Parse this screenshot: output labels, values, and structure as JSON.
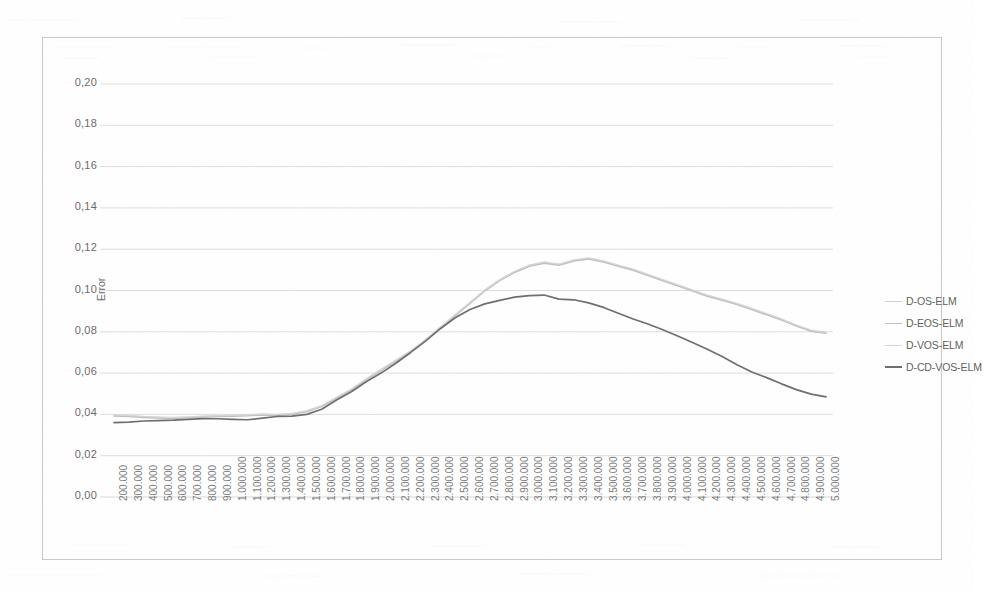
{
  "axes": {
    "y_title": "Error",
    "y_ticks": [
      "0,20",
      "0,18",
      "0,16",
      "0,14",
      "0,12",
      "0,10",
      "0,08",
      "0,06",
      "0,04",
      "0,02",
      "0,00"
    ],
    "x_ticks": [
      "200.000",
      "300.000",
      "400.000",
      "500.000",
      "600.000",
      "700.000",
      "800.000",
      "900.000",
      "1.000.000",
      "1.100.000",
      "1.200.000",
      "1.300.000",
      "1.400.000",
      "1.500.000",
      "1.600.000",
      "1.700.000",
      "1.800.000",
      "1.900.000",
      "2.000.000",
      "2.100.000",
      "2.200.000",
      "2.300.000",
      "2.400.000",
      "2.500.000",
      "2.600.000",
      "2.700.000",
      "2.800.000",
      "2.900.000",
      "3.000.000",
      "3.100.000",
      "3.200.000",
      "3.300.000",
      "3.400.000",
      "3.500.000",
      "3.600.000",
      "3.700.000",
      "3.800.000",
      "3.900.000",
      "4.000.000",
      "4.100.000",
      "4.200.000",
      "4.300.000",
      "4.400.000",
      "4.500.000",
      "4.600.000",
      "4.700.000",
      "4.800.000",
      "4.900.000",
      "5.000.000"
    ]
  },
  "legend": {
    "items": [
      {
        "label": "D-OS-ELM",
        "color": "#cfcfcf"
      },
      {
        "label": "D-EOS-ELM",
        "color": "#bfbfbf"
      },
      {
        "label": "D-VOS-ELM",
        "color": "#d6d6d6"
      },
      {
        "label": "D-CD-VOS-ELM",
        "color": "#6e6e6e"
      }
    ]
  },
  "chart_data": {
    "type": "line",
    "title": "",
    "xlabel": "",
    "ylabel": "Error",
    "ylim": [
      0.0,
      0.2
    ],
    "grid": true,
    "legend_position": "right",
    "x": [
      200000,
      300000,
      400000,
      500000,
      600000,
      700000,
      800000,
      900000,
      1000000,
      1100000,
      1200000,
      1300000,
      1400000,
      1500000,
      1600000,
      1700000,
      1800000,
      1900000,
      2000000,
      2100000,
      2200000,
      2300000,
      2400000,
      2500000,
      2600000,
      2700000,
      2800000,
      2900000,
      3000000,
      3100000,
      3200000,
      3300000,
      3400000,
      3500000,
      3600000,
      3700000,
      3800000,
      3900000,
      4000000,
      4100000,
      4200000,
      4300000,
      4400000,
      4500000,
      4600000,
      4700000,
      4800000,
      4900000,
      5000000
    ],
    "series": [
      {
        "name": "D-OS-ELM",
        "color": "#cfcfcf",
        "values": [
          0.0395,
          0.0392,
          0.0388,
          0.0385,
          0.0383,
          0.0386,
          0.039,
          0.0392,
          0.0394,
          0.0396,
          0.04,
          0.0398,
          0.0403,
          0.0415,
          0.044,
          0.048,
          0.052,
          0.057,
          0.0615,
          0.066,
          0.0705,
          0.076,
          0.082,
          0.088,
          0.094,
          0.1,
          0.105,
          0.109,
          0.112,
          0.1135,
          0.1125,
          0.1145,
          0.1155,
          0.114,
          0.112,
          0.11,
          0.1075,
          0.105,
          0.1025,
          0.1,
          0.0975,
          0.0955,
          0.0935,
          0.091,
          0.0885,
          0.086,
          0.083,
          0.0805,
          0.0795
        ]
      },
      {
        "name": "D-EOS-ELM",
        "color": "#bfbfbf",
        "values": [
          0.0392,
          0.0389,
          0.0385,
          0.0382,
          0.038,
          0.0383,
          0.0387,
          0.0389,
          0.0391,
          0.0393,
          0.0397,
          0.0395,
          0.04,
          0.0412,
          0.0437,
          0.0477,
          0.0517,
          0.0567,
          0.0612,
          0.0657,
          0.0702,
          0.0757,
          0.0817,
          0.0877,
          0.0937,
          0.0997,
          0.1047,
          0.1087,
          0.1117,
          0.1132,
          0.1122,
          0.1142,
          0.1152,
          0.1137,
          0.1117,
          0.1097,
          0.1072,
          0.1047,
          0.1022,
          0.0997,
          0.0972,
          0.0952,
          0.0932,
          0.0907,
          0.0882,
          0.0857,
          0.0827,
          0.0802,
          0.0792
        ]
      },
      {
        "name": "D-VOS-ELM",
        "color": "#d6d6d6",
        "values": [
          0.0398,
          0.0395,
          0.039,
          0.0387,
          0.0385,
          0.0388,
          0.0392,
          0.0394,
          0.0396,
          0.0398,
          0.0402,
          0.04,
          0.0405,
          0.0418,
          0.0443,
          0.0483,
          0.0523,
          0.0573,
          0.0618,
          0.0663,
          0.0708,
          0.0763,
          0.0823,
          0.0883,
          0.0943,
          0.1003,
          0.1053,
          0.1093,
          0.1123,
          0.1138,
          0.1128,
          0.1148,
          0.1158,
          0.1143,
          0.1123,
          0.1103,
          0.1078,
          0.1053,
          0.1028,
          0.1003,
          0.0978,
          0.0958,
          0.0938,
          0.0913,
          0.0888,
          0.0863,
          0.0833,
          0.0808,
          0.0798
        ]
      },
      {
        "name": "D-CD-VOS-ELM",
        "color": "#6e6e6e",
        "values": [
          0.036,
          0.0363,
          0.0368,
          0.037,
          0.0372,
          0.0376,
          0.038,
          0.0379,
          0.0376,
          0.0374,
          0.0382,
          0.039,
          0.0392,
          0.04,
          0.0425,
          0.047,
          0.051,
          0.0558,
          0.06,
          0.0648,
          0.07,
          0.0755,
          0.0815,
          0.0868,
          0.0908,
          0.0935,
          0.0952,
          0.0968,
          0.0975,
          0.0978,
          0.0958,
          0.0955,
          0.094,
          0.0918,
          0.089,
          0.0862,
          0.0838,
          0.081,
          0.078,
          0.0748,
          0.0715,
          0.068,
          0.064,
          0.0605,
          0.0578,
          0.0548,
          0.052,
          0.0498,
          0.0485
        ]
      }
    ]
  }
}
